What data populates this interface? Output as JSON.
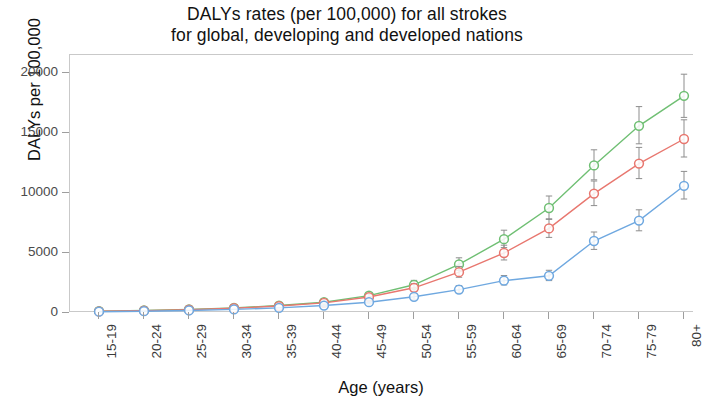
{
  "chart_data": {
    "type": "line",
    "title": "DALYs rates (per 100,000) for all strokes for global, developing and developed nations",
    "title_lines": [
      "DALYs rates (per 100,000) for all strokes",
      "for global, developing and developed nations"
    ],
    "xlabel": "Age (years)",
    "ylabel": "DALYs per 100,000",
    "categories": [
      "15-19",
      "20-24",
      "25-29",
      "30-34",
      "35-39",
      "40-44",
      "45-49",
      "50-54",
      "55-59",
      "60-64",
      "65-69",
      "70-74",
      "75-79",
      "80+"
    ],
    "ylim": [
      0,
      21500
    ],
    "yticks": [
      0,
      5000,
      10000,
      15000,
      20000
    ],
    "ytick_labels": [
      "0",
      "5000",
      "10000",
      "15000",
      "20000"
    ],
    "grid": false,
    "legend": "none",
    "error_bars": true,
    "marker": "open-circle",
    "series": [
      {
        "name": "developing",
        "color": "#6fbf73",
        "values": [
          150,
          210,
          300,
          430,
          620,
          900,
          1450,
          2350,
          4050,
          6150,
          8750,
          12300,
          15600,
          18100
        ],
        "err_low": [
          120,
          170,
          250,
          360,
          520,
          760,
          1240,
          2020,
          3550,
          5450,
          7800,
          11100,
          14100,
          16300
        ],
        "err_high": [
          190,
          260,
          370,
          520,
          740,
          1070,
          1700,
          2720,
          4600,
          6900,
          9750,
          13600,
          17200,
          19900
        ]
      },
      {
        "name": "global",
        "color": "#e8776f",
        "values": [
          140,
          195,
          280,
          400,
          580,
          840,
          1330,
          2100,
          3400,
          5000,
          7050,
          9950,
          12450,
          14500
        ],
        "err_low": [
          115,
          160,
          235,
          340,
          490,
          715,
          1140,
          1810,
          2980,
          4420,
          6300,
          8950,
          11200,
          13000
        ],
        "err_high": [
          175,
          240,
          340,
          480,
          690,
          990,
          1550,
          2440,
          3880,
          5650,
          7850,
          11000,
          13800,
          16100
        ]
      },
      {
        "name": "developed",
        "color": "#6fa8e0",
        "values": [
          110,
          150,
          210,
          300,
          430,
          620,
          900,
          1350,
          1950,
          2700,
          3100,
          6000,
          7700,
          10600
        ],
        "err_low": [
          90,
          125,
          175,
          250,
          360,
          520,
          760,
          1150,
          1680,
          2340,
          2700,
          5300,
          6850,
          9500
        ],
        "err_high": [
          135,
          185,
          255,
          365,
          520,
          745,
          1070,
          1590,
          2280,
          3120,
          3560,
          6750,
          8600,
          11800
        ]
      }
    ]
  }
}
